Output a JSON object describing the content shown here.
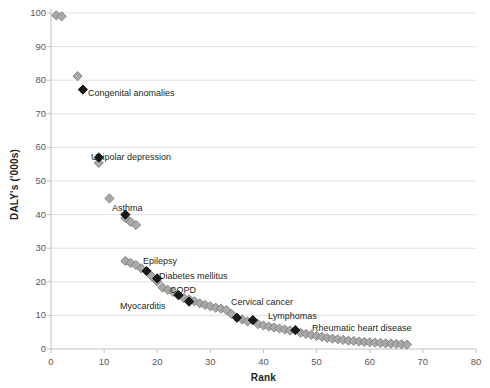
{
  "chart_data": {
    "type": "scatter",
    "title": "",
    "xlabel": "Rank",
    "ylabel": "DALY's ('000s)",
    "xlim": [
      0,
      80
    ],
    "ylim": [
      0,
      100
    ],
    "xticks": [
      0,
      10,
      20,
      30,
      40,
      50,
      60,
      70,
      80
    ],
    "yticks": [
      0,
      10,
      20,
      30,
      40,
      50,
      60,
      70,
      80,
      90,
      100
    ],
    "grid": "horizontal",
    "legend": "none",
    "marker": "diamond",
    "series": [
      {
        "name": "All causes",
        "color": "#a9a9a9",
        "edge_color": "#7d7d7d",
        "points": [
          {
            "x": 1,
            "y": 99.3
          },
          {
            "x": 2,
            "y": 99.0
          },
          {
            "x": 5,
            "y": 81.2
          },
          {
            "x": 9,
            "y": 55.4
          },
          {
            "x": 11,
            "y": 44.8
          },
          {
            "x": 14,
            "y": 39.0
          },
          {
            "x": 15,
            "y": 37.8
          },
          {
            "x": 16,
            "y": 36.9
          },
          {
            "x": 14,
            "y": 26.2
          },
          {
            "x": 15,
            "y": 25.6
          },
          {
            "x": 16,
            "y": 25.0
          },
          {
            "x": 17,
            "y": 24.0
          },
          {
            "x": 19,
            "y": 21.6
          },
          {
            "x": 20,
            "y": 20.1
          },
          {
            "x": 21,
            "y": 18.3
          },
          {
            "x": 22,
            "y": 17.6
          },
          {
            "x": 23,
            "y": 17.0
          },
          {
            "x": 25,
            "y": 15.2
          },
          {
            "x": 26,
            "y": 14.8
          },
          {
            "x": 27,
            "y": 14.2
          },
          {
            "x": 28,
            "y": 13.6
          },
          {
            "x": 29,
            "y": 13.1
          },
          {
            "x": 30,
            "y": 12.7
          },
          {
            "x": 31,
            "y": 12.3
          },
          {
            "x": 32,
            "y": 12.0
          },
          {
            "x": 33,
            "y": 11.6
          },
          {
            "x": 34,
            "y": 10.4
          },
          {
            "x": 36,
            "y": 8.8
          },
          {
            "x": 37,
            "y": 8.2
          },
          {
            "x": 39,
            "y": 7.4
          },
          {
            "x": 40,
            "y": 7.0
          },
          {
            "x": 41,
            "y": 6.7
          },
          {
            "x": 42,
            "y": 6.4
          },
          {
            "x": 43,
            "y": 6.1
          },
          {
            "x": 44,
            "y": 5.8
          },
          {
            "x": 45,
            "y": 5.5
          },
          {
            "x": 47,
            "y": 4.8
          },
          {
            "x": 48,
            "y": 4.5
          },
          {
            "x": 49,
            "y": 4.2
          },
          {
            "x": 50,
            "y": 3.9
          },
          {
            "x": 51,
            "y": 3.6
          },
          {
            "x": 52,
            "y": 3.3
          },
          {
            "x": 53,
            "y": 3.1
          },
          {
            "x": 54,
            "y": 2.9
          },
          {
            "x": 55,
            "y": 2.7
          },
          {
            "x": 56,
            "y": 2.5
          },
          {
            "x": 57,
            "y": 2.4
          },
          {
            "x": 58,
            "y": 2.2
          },
          {
            "x": 59,
            "y": 2.1
          },
          {
            "x": 60,
            "y": 2.0
          },
          {
            "x": 61,
            "y": 1.9
          },
          {
            "x": 62,
            "y": 1.8
          },
          {
            "x": 63,
            "y": 1.7
          },
          {
            "x": 64,
            "y": 1.6
          },
          {
            "x": 65,
            "y": 1.5
          },
          {
            "x": 66,
            "y": 1.4
          },
          {
            "x": 67,
            "y": 1.3
          }
        ]
      },
      {
        "name": "Highlighted causes",
        "color": "#1a1a1a",
        "edge_color": "#000000",
        "points": [
          {
            "x": 6,
            "y": 77.2,
            "label": "Congenital anomalies"
          },
          {
            "x": 9,
            "y": 57.0,
            "label": "Unipolar depression"
          },
          {
            "x": 14,
            "y": 40.0,
            "label": "Asthma"
          },
          {
            "x": 18,
            "y": 23.2,
            "label": "Epilepsy"
          },
          {
            "x": 20,
            "y": 21.0,
            "label": "Diabetes mellitus"
          },
          {
            "x": 24,
            "y": 16.0,
            "label": "COPD"
          },
          {
            "x": 26,
            "y": 14.1,
            "label": "Myocarditis"
          },
          {
            "x": 35,
            "y": 9.3,
            "label": "Cervical cancer"
          },
          {
            "x": 38,
            "y": 8.6,
            "label": "Lymphomas"
          },
          {
            "x": 46,
            "y": 5.6,
            "label": "Rheumatic heart disease"
          }
        ]
      }
    ],
    "annotations": [
      {
        "text": "Congenital anomalies",
        "x": 88,
        "y": 88
      },
      {
        "text": "Unipolar depression",
        "x": 91,
        "y": 152
      },
      {
        "text": "Asthma",
        "x": 112,
        "y": 203
      },
      {
        "text": "Epilepsy",
        "x": 143,
        "y": 256
      },
      {
        "text": "Diabetes mellitus",
        "x": 159,
        "y": 271
      },
      {
        "text": "COPD",
        "x": 170,
        "y": 285
      },
      {
        "text": "Myocarditis",
        "x": 120,
        "y": 301
      },
      {
        "text": "Cervical cancer",
        "x": 231,
        "y": 297
      },
      {
        "text": "Lymphomas",
        "x": 268,
        "y": 311
      },
      {
        "text": "Rheumatic heart disease",
        "x": 312,
        "y": 323
      }
    ]
  }
}
